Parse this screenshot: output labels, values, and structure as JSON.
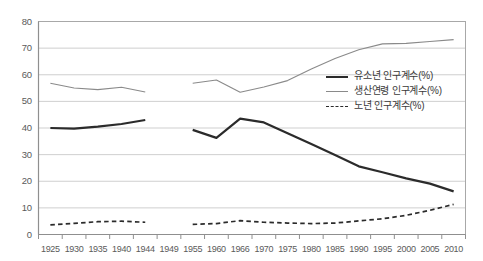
{
  "chart_data": {
    "type": "line",
    "title": "",
    "xlabel": "",
    "ylabel": "",
    "ylim": [
      0,
      80
    ],
    "ytick_step": 10,
    "grid": true,
    "legend_position": "center-right",
    "categories": [
      "1925",
      "1930",
      "1935",
      "1940",
      "1944",
      "1949",
      "1955",
      "1960",
      "1966",
      "1970",
      "1975",
      "1980",
      "1985",
      "1990",
      "1995",
      "2000",
      "2005",
      "2010"
    ],
    "yticks": [
      "0",
      "10",
      "20",
      "30",
      "40",
      "50",
      "60",
      "70",
      "80"
    ],
    "series": [
      {
        "name": "유소년 인구계수(%)",
        "style": "thick-solid",
        "color": "#2b2b2b",
        "values": [
          40.0,
          39.8,
          40.5,
          41.5,
          43.0,
          null,
          39.3,
          36.3,
          43.5,
          42.1,
          38.0,
          34.0,
          29.9,
          25.6,
          23.4,
          21.1,
          19.1,
          16.2
        ]
      },
      {
        "name": "생산연령 인구계수(%)",
        "style": "thin-solid",
        "color": "#8a8a8a",
        "values": [
          56.8,
          55.0,
          54.4,
          55.3,
          53.5,
          null,
          56.8,
          58.0,
          53.4,
          55.4,
          57.8,
          62.2,
          66.1,
          69.4,
          71.6,
          71.8,
          72.5,
          73.2
        ]
      },
      {
        "name": "노년 인구계수(%)",
        "style": "dashed",
        "color": "#2b2b2b",
        "values": [
          3.6,
          4.2,
          4.8,
          5.0,
          4.6,
          null,
          3.8,
          4.1,
          5.2,
          4.6,
          4.3,
          4.1,
          4.3,
          5.1,
          5.9,
          7.2,
          9.1,
          11.3
        ]
      }
    ]
  },
  "legend": {
    "items": [
      {
        "label": "유소년 인구계수(%)"
      },
      {
        "label": "생산연령 인구계수(%)"
      },
      {
        "label": "노년 인구계수(%)"
      }
    ]
  }
}
